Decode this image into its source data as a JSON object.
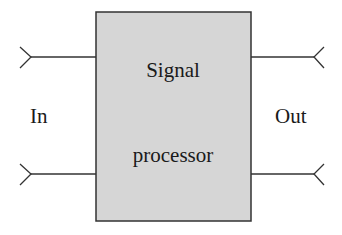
{
  "diagram": {
    "type": "block-diagram",
    "block": {
      "label_line1": "Signal",
      "label_line2": "processor",
      "fill": "#d6d6d6",
      "stroke": "#333333"
    },
    "input": {
      "label": "In",
      "terminals": 2
    },
    "output": {
      "label": "Out",
      "terminals": 2
    }
  }
}
